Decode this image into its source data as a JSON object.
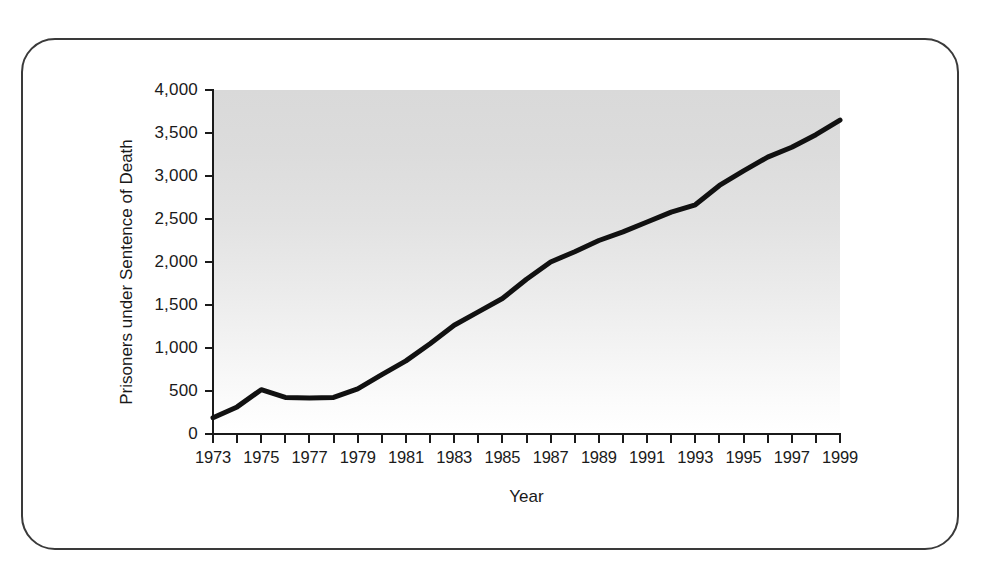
{
  "figure": {
    "frame_style": "rounded-rectangle-border",
    "border_color": "#3a3a3a",
    "background_color": "#ffffff"
  },
  "chart_data": {
    "type": "line",
    "title": "",
    "subtitle": "",
    "xlabel": "Year",
    "ylabel": "Prisoners under Sentence of Death",
    "xlim": [
      1973,
      1999
    ],
    "ylim": [
      0,
      4000
    ],
    "grid": false,
    "legend": null,
    "legend_position": "none",
    "line_color": "#111111",
    "line_width_px": 5,
    "plot_background": "vertical gray gradient, dark at top fading to white at bottom",
    "y_ticks": [
      0,
      500,
      1000,
      1500,
      2000,
      2500,
      3000,
      3500,
      4000
    ],
    "y_tick_labels": [
      "0",
      "500",
      "1,000",
      "1,500",
      "2,000",
      "2,500",
      "3,000",
      "3,500",
      "4,000"
    ],
    "x_ticks": [
      1973,
      1974,
      1975,
      1976,
      1977,
      1978,
      1979,
      1980,
      1981,
      1982,
      1983,
      1984,
      1985,
      1986,
      1987,
      1988,
      1989,
      1990,
      1991,
      1992,
      1993,
      1994,
      1995,
      1996,
      1997,
      1998,
      1999
    ],
    "x_tick_labels_shown": [
      "1973",
      "1975",
      "1977",
      "1979",
      "1981",
      "1983",
      "1985",
      "1987",
      "1989",
      "1991",
      "1993",
      "1995",
      "1997",
      "1999"
    ],
    "x": [
      1973,
      1974,
      1975,
      1976,
      1977,
      1978,
      1979,
      1980,
      1981,
      1982,
      1983,
      1984,
      1985,
      1986,
      1987,
      1988,
      1989,
      1990,
      1991,
      1992,
      1993,
      1994,
      1995,
      1996,
      1997,
      1998,
      1999
    ],
    "values": [
      190,
      315,
      515,
      425,
      420,
      425,
      525,
      690,
      850,
      1050,
      1265,
      1420,
      1575,
      1800,
      2000,
      2120,
      2250,
      2350,
      2465,
      2580,
      2665,
      2890,
      3060,
      3220,
      3335,
      3480,
      3650
    ],
    "series": [
      {
        "name": "Prisoners under Sentence of Death",
        "values": [
          190,
          315,
          515,
          425,
          420,
          425,
          525,
          690,
          850,
          1050,
          1265,
          1420,
          1575,
          1800,
          2000,
          2120,
          2250,
          2350,
          2465,
          2580,
          2665,
          2890,
          3060,
          3220,
          3335,
          3480,
          3650
        ]
      }
    ],
    "annotations": []
  }
}
